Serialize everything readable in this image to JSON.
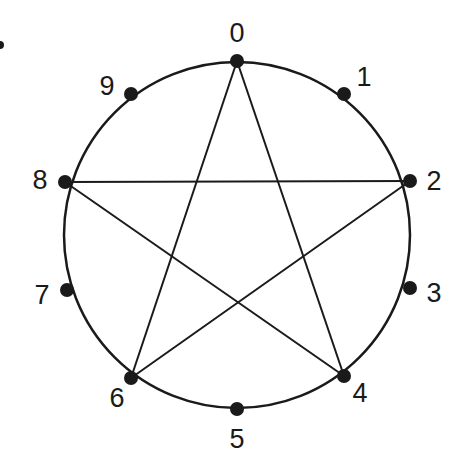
{
  "diagram": {
    "type": "circular-graph",
    "circle": {
      "cx": 237,
      "cy": 235,
      "r": 173,
      "stroke": "#1a1a1a"
    },
    "nodes": [
      {
        "id": "0",
        "label": "0",
        "x": 237,
        "y": 61,
        "lx": 237,
        "ly": 42
      },
      {
        "id": "1",
        "label": "1",
        "x": 344,
        "y": 94,
        "lx": 364,
        "ly": 86
      },
      {
        "id": "2",
        "label": "2",
        "x": 410,
        "y": 181,
        "lx": 434,
        "ly": 190
      },
      {
        "id": "3",
        "label": "3",
        "x": 410,
        "y": 288,
        "lx": 434,
        "ly": 302
      },
      {
        "id": "4",
        "label": "4",
        "x": 344,
        "y": 376,
        "lx": 360,
        "ly": 402
      },
      {
        "id": "5",
        "label": "5",
        "x": 237,
        "y": 409,
        "lx": 237,
        "ly": 448
      },
      {
        "id": "6",
        "label": "6",
        "x": 131,
        "y": 378,
        "lx": 117,
        "ly": 407
      },
      {
        "id": "7",
        "label": "7",
        "x": 67,
        "y": 290,
        "lx": 42,
        "ly": 304
      },
      {
        "id": "8",
        "label": "8",
        "x": 65,
        "y": 182,
        "lx": 40,
        "ly": 189
      },
      {
        "id": "9",
        "label": "9",
        "x": 131,
        "y": 94,
        "lx": 107,
        "ly": 95
      }
    ],
    "edges": [
      {
        "from": "0",
        "to": "4"
      },
      {
        "from": "0",
        "to": "6"
      },
      {
        "from": "8",
        "to": "2"
      },
      {
        "from": "8",
        "to": "4"
      },
      {
        "from": "2",
        "to": "6"
      }
    ],
    "stray_mark": {
      "x": 0,
      "y": 45
    }
  }
}
